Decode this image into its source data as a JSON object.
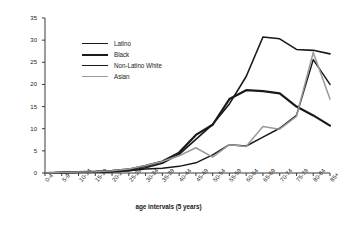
{
  "chart_data": {
    "type": "line",
    "title": "",
    "xlabel": "age intervals (5 years)",
    "ylabel": "age-specific incidence rate",
    "ylim": [
      0,
      35
    ],
    "yticks": [
      0,
      5,
      10,
      15,
      20,
      25,
      30,
      35
    ],
    "grid": false,
    "legend_position": "upper-left-inside",
    "categories": [
      "0-4",
      "5-9",
      "10-14",
      "15-19",
      "20-24",
      "25-29",
      "30-34",
      "35-39",
      "40-44",
      "45-49",
      "50-54",
      "55-59",
      "60-64",
      "65-69",
      "70-74",
      "75-79",
      "80-84",
      "85+"
    ],
    "series": [
      {
        "name": "Latino",
        "color": "#1a1a1a",
        "width": 1.6,
        "values": [
          0.0,
          0.1,
          0.2,
          0.2,
          0.3,
          0.5,
          1.2,
          2.2,
          4.2,
          7.6,
          11.0,
          15.6,
          21.8,
          30.7,
          30.3,
          27.9,
          27.7,
          26.9
        ]
      },
      {
        "name": "Black",
        "color": "#1a1a1a",
        "width": 2.2,
        "values": [
          0.0,
          0.1,
          0.2,
          0.3,
          0.5,
          0.8,
          1.6,
          2.6,
          4.6,
          8.6,
          10.9,
          16.7,
          18.7,
          18.5,
          18.0,
          15.0,
          13.0,
          10.7
        ]
      },
      {
        "name": "Non-Latino White",
        "color": "#1a1a1a",
        "width": 1.5,
        "values": [
          0.0,
          0.1,
          0.2,
          0.2,
          0.3,
          0.5,
          0.9,
          1.1,
          1.5,
          2.3,
          4.1,
          6.4,
          6.1,
          8.1,
          10.1,
          13.0,
          25.6,
          20.0
        ]
      },
      {
        "name": "Asian",
        "color": "#9a9a9a",
        "width": 1.5,
        "values": [
          0.0,
          0.1,
          0.2,
          0.3,
          0.5,
          0.9,
          1.7,
          2.6,
          3.9,
          5.7,
          3.6,
          6.4,
          6.0,
          10.5,
          9.9,
          12.8,
          27.2,
          16.7
        ]
      }
    ]
  },
  "legend": {
    "items": [
      {
        "label": "Latino"
      },
      {
        "label": "Black"
      },
      {
        "label": "Non-Latino White"
      },
      {
        "label": "Asian"
      }
    ]
  }
}
